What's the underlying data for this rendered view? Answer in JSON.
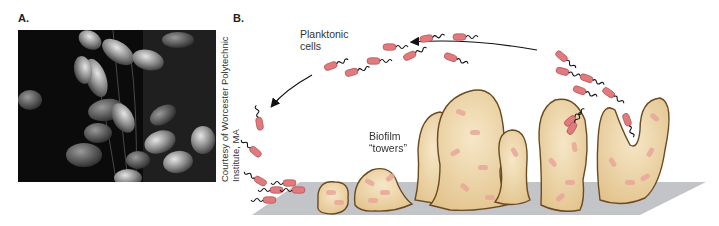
{
  "figure": {
    "panel_a": {
      "label": "A.",
      "image_description": "Scanning electron micrograph of rod-shaped bacteria in a biofilm",
      "credit_line1": "Courtesy of Worcester Polytechnic",
      "credit_line2": "Institute, MA"
    },
    "panel_b": {
      "label": "B.",
      "caption_planktonic_line1": "Planktonic",
      "caption_planktonic_line2": "cells",
      "caption_biofilm_line1": "Biofilm",
      "caption_biofilm_line2": "“towers”"
    },
    "colors": {
      "background": "#ffffff",
      "photo_bg": "#0b0b0b",
      "cell_fill": "#e07a7d",
      "cell_stroke": "#b44f55",
      "tower_fill": "#ecd3a1",
      "tower_stroke": "#6b4a22",
      "surface": "#bfc1c5",
      "arrow": "#111111"
    }
  }
}
